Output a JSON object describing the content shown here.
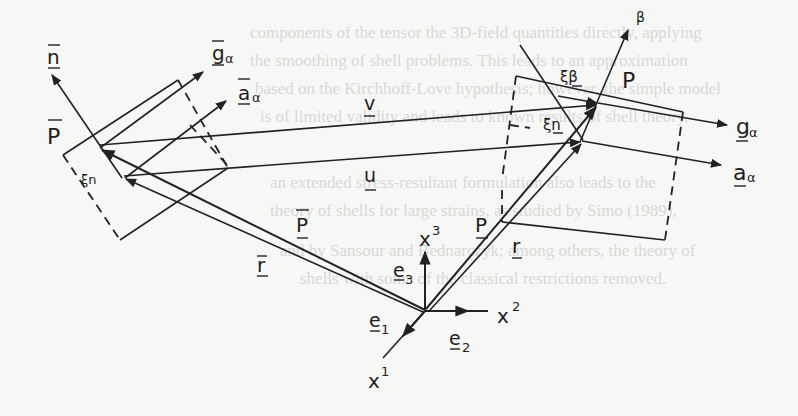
{
  "figure": {
    "background_text_lines": [
      "components of the tensor the 3D-field quantities directly, applying",
      "the smoothing of shell problems. This leads to an approximation",
      "based on the Kirchhoff-Love hypothesis; however, the simple model",
      "is of limited validity and leads to known results of shell theory,",
      "an extended stress-resultant formulation also leads to the",
      "theory of shells for large strains, as studied by Simo (1989),",
      "and by Sansour and Bednarczyk; among others, the theory of",
      "shells with some of the classical restrictions removed."
    ],
    "labels": {
      "n_bar": "n",
      "g_alpha_bar": "g",
      "a_alpha_bar": "a",
      "alpha_sub": "α",
      "P_bar_point": "P",
      "xi_n_bar": "ξn",
      "v": "v",
      "u": "u",
      "P_bar_vec": "P",
      "r_bar": "r",
      "beta_top": "β",
      "xi_beta": "ξβ",
      "P_point": "P",
      "xi_n": "ξn",
      "g_alpha": "g",
      "a_alpha": "a",
      "P_vec": "P",
      "r_vec": "r",
      "x1": "x",
      "x1_sup": "1",
      "x2": "x",
      "x2_sup": "2",
      "x3": "x",
      "x3_sup": "3",
      "e1": "e",
      "e1_sub": "1",
      "e2": "e",
      "e2_sub": "2",
      "e3": "e",
      "e3_sub": "3"
    },
    "stroke_color": "#222222",
    "paper_color": "#f7f7f5"
  }
}
